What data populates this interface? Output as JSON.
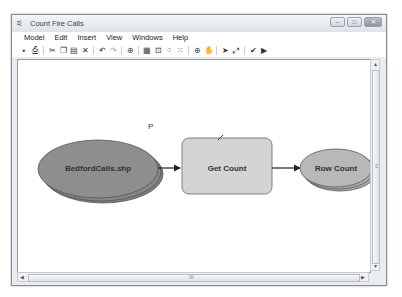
{
  "window": {
    "title": "Count Fire Calls",
    "controls": {
      "minimize": "–",
      "maximize": "□",
      "close": "✕"
    }
  },
  "menubar": {
    "items": [
      {
        "label": "Model"
      },
      {
        "label": "Edit"
      },
      {
        "label": "Insert"
      },
      {
        "label": "View"
      },
      {
        "label": "Windows"
      },
      {
        "label": "Help"
      }
    ]
  },
  "toolbar": {
    "items": [
      {
        "name": "save-icon",
        "glyph": "▪"
      },
      {
        "name": "print-icon",
        "glyph": "⎙"
      },
      {
        "name": "cut-icon",
        "glyph": "✂"
      },
      {
        "name": "copy-icon",
        "glyph": "❐"
      },
      {
        "name": "paste-icon",
        "glyph": "▤"
      },
      {
        "name": "delete-icon",
        "glyph": "✕"
      },
      {
        "name": "undo-icon",
        "glyph": "↶"
      },
      {
        "name": "redo-icon",
        "glyph": "↷"
      },
      {
        "name": "add-data-icon",
        "glyph": "⊕"
      },
      {
        "name": "auto-layout-icon",
        "glyph": "▦"
      },
      {
        "name": "full-extent-icon",
        "glyph": "⊡"
      },
      {
        "name": "fixed-zoom-in-icon",
        "glyph": "⁘"
      },
      {
        "name": "fixed-zoom-out-icon",
        "glyph": "⁙"
      },
      {
        "name": "zoom-in-icon",
        "glyph": "⊕"
      },
      {
        "name": "pan-icon",
        "glyph": "✋"
      },
      {
        "name": "select-icon",
        "glyph": "➤"
      },
      {
        "name": "connect-icon",
        "glyph": "⤢"
      },
      {
        "name": "validate-icon",
        "glyph": "✔"
      },
      {
        "name": "run-icon",
        "glyph": "▶"
      }
    ]
  },
  "canvas": {
    "p_label": "P",
    "nodes": {
      "input": {
        "label": "BedfordCalls.shp",
        "color": "#8e8e8e"
      },
      "tool": {
        "label": "Get Count",
        "color": "#d2d2d2"
      },
      "output": {
        "label": "Row Count",
        "color": "#b8b8b8"
      }
    }
  },
  "scrollbars": {
    "grip": "≡",
    "hgrip": "III"
  }
}
